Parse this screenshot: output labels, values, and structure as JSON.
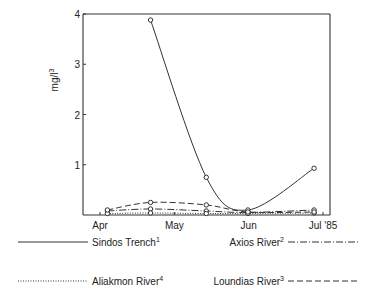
{
  "chart_data": {
    "type": "line",
    "title": "",
    "xlabel": "",
    "ylabel": "mg/l",
    "ylabel_superscript": "3",
    "ylim": [
      0,
      4
    ],
    "yticks": [
      "1",
      "2",
      "3",
      "4"
    ],
    "ytick_values": [
      1,
      2,
      3,
      4
    ],
    "xticks": [
      "Apr",
      "May",
      "Jun",
      "Jul '85"
    ],
    "xtick_values": [
      0,
      1,
      2,
      3
    ],
    "xlim": [
      0,
      3.1
    ],
    "grid": false,
    "legend_position": "bottom",
    "series": [
      {
        "name": "Sindos Trench",
        "superscript": "1",
        "style": "solid",
        "x": [
          0.68,
          1.43,
          1.99,
          2.88
        ],
        "y": [
          3.88,
          0.75,
          0.1,
          0.93
        ]
      },
      {
        "name": "Axios River",
        "superscript": "2",
        "style": "dashdot",
        "x": [
          0.1,
          0.68,
          1.43,
          1.99,
          2.88
        ],
        "y": [
          0.08,
          0.12,
          0.08,
          0.05,
          0.1
        ]
      },
      {
        "name": "Aliakmon River",
        "superscript": "4",
        "style": "dotted",
        "x": [
          0.1,
          0.68,
          1.43,
          1.99,
          2.88
        ],
        "y": [
          0.03,
          0.04,
          0.03,
          0.03,
          0.04
        ]
      },
      {
        "name": "Loundias River",
        "superscript": "3",
        "style": "dashed",
        "x": [
          0.1,
          0.68,
          1.43,
          1.99,
          2.88
        ],
        "y": [
          0.1,
          0.25,
          0.2,
          0.06,
          0.06
        ]
      }
    ]
  }
}
